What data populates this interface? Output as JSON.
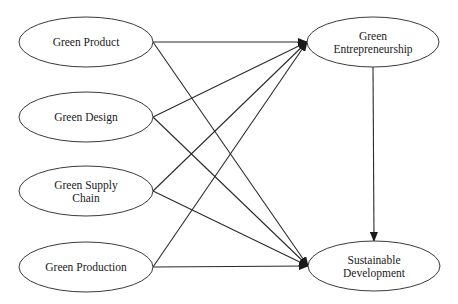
{
  "diagram": {
    "type": "path-model",
    "nodes": [
      {
        "id": "green_product",
        "lines": [
          "Green Product"
        ],
        "cx": 86,
        "cy": 42,
        "rx": 67,
        "ry": 25
      },
      {
        "id": "green_design",
        "lines": [
          "Green Design"
        ],
        "cx": 86,
        "cy": 117,
        "rx": 67,
        "ry": 25
      },
      {
        "id": "green_supply_chain",
        "lines": [
          "Green Supply",
          "Chain"
        ],
        "cx": 86,
        "cy": 191,
        "rx": 67,
        "ry": 25
      },
      {
        "id": "green_production",
        "lines": [
          "Green Production"
        ],
        "cx": 86,
        "cy": 267,
        "rx": 67,
        "ry": 25
      },
      {
        "id": "green_entrepreneurship",
        "lines": [
          "Green",
          "Entrepreneurship"
        ],
        "cx": 373,
        "cy": 42,
        "rx": 66,
        "ry": 25
      },
      {
        "id": "sustainable_development",
        "lines": [
          "Sustainable",
          "Development"
        ],
        "cx": 374,
        "cy": 266,
        "rx": 66,
        "ry": 25
      }
    ],
    "edges": [
      {
        "from": "green_product",
        "to": "green_entrepreneurship"
      },
      {
        "from": "green_product",
        "to": "sustainable_development"
      },
      {
        "from": "green_design",
        "to": "green_entrepreneurship"
      },
      {
        "from": "green_design",
        "to": "sustainable_development"
      },
      {
        "from": "green_supply_chain",
        "to": "green_entrepreneurship"
      },
      {
        "from": "green_supply_chain",
        "to": "sustainable_development"
      },
      {
        "from": "green_production",
        "to": "green_entrepreneurship"
      },
      {
        "from": "green_production",
        "to": "sustainable_development"
      },
      {
        "from": "green_entrepreneurship",
        "to": "sustainable_development"
      }
    ]
  }
}
